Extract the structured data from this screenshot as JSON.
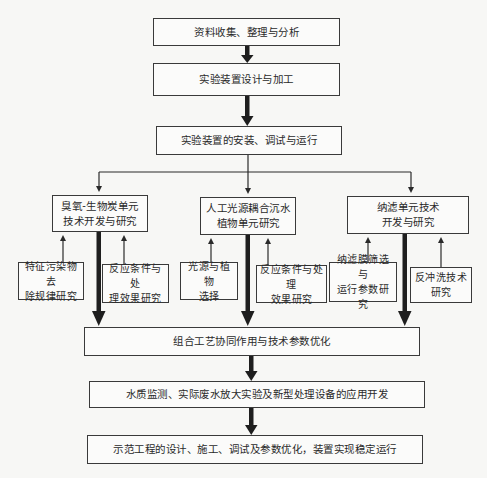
{
  "diagram": {
    "type": "flowchart",
    "steps": {
      "step1": "资料收集、整理与分析",
      "step2": "实验装置设计与加工",
      "step3": "实验装置的安装、调试与运行",
      "combine": "组合工艺协同作用与技术参数优化",
      "water": "水质监测、实际废水放大实验及新型处理设备的应用开发",
      "demo": "示范工程的设计、施工、调试及参数优化，装置实现稳定运行"
    },
    "units": [
      {
        "title": "臭氧-生物炭单元\n技术开发与研究",
        "subs": [
          "特征污染物去\n除规律研究",
          "反应条件与处\n理效果研究"
        ]
      },
      {
        "title": "人工光源耦合沉水\n植物单元研究",
        "subs": [
          "光源与植物\n选择",
          "反应条件与处理\n效果研究"
        ]
      },
      {
        "title": "纳滤单元技术\n开发与研究",
        "subs": [
          "纳滤膜筛选与\n运行参数研究",
          "反冲洗技术\n研究"
        ]
      }
    ],
    "colors": {
      "line": "#3a3a3a",
      "thick_arrow": "#1e1e1e",
      "box_fill": "#fbfbfa",
      "background": "#f7f7f5"
    }
  }
}
